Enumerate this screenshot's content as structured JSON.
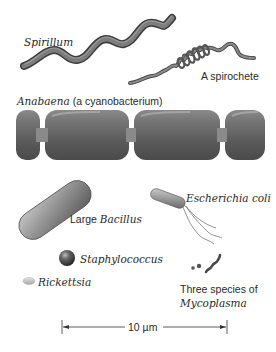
{
  "figure": {
    "organisms": {
      "spirillum": {
        "label": "Spirillum"
      },
      "spirochete": {
        "label": "A spirochete"
      },
      "anabaena": {
        "label_italic": "Anabaena",
        "label_plain": " (a cyanobacterium)"
      },
      "bacillus": {
        "label_plain": "Large ",
        "label_italic": "Bacillus"
      },
      "ecoli": {
        "label": "Escherichia coli"
      },
      "staphylococcus": {
        "label": "Staphylococcus"
      },
      "rickettsia": {
        "label": "Rickettsia"
      },
      "mycoplasma": {
        "label_line1": "Three species of",
        "label_line2": "Mycoplasma"
      }
    },
    "scale_bar": {
      "label": "10 µm",
      "value": 10,
      "unit": "µm"
    },
    "colors": {
      "cell_dark": "#4a4a4a",
      "cell_mid": "#7a7a7a",
      "cell_light": "#b5b5b5",
      "text": "#2a2a2a",
      "background": "#ffffff"
    }
  }
}
